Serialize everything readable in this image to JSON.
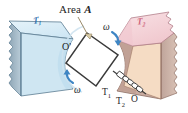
{
  "figure": {
    "caption_labels": {
      "area_label_prefix": "Area ",
      "area_label_symbol": "A",
      "origin_prime": "O'",
      "origin": "O",
      "omega_top": "ω",
      "omega_bottom": "ω",
      "reservoir_hot_label": "T",
      "reservoir_hot_sub": "1",
      "reservoir_cold_label": "T",
      "reservoir_cold_sub": "2",
      "block_left_label": "T",
      "block_left_sub": "1",
      "block_right_label": "T",
      "block_right_sub": "2"
    },
    "colors": {
      "block_left_top": "#d8ecf5",
      "block_left_front": "#cfe6f2",
      "block_left_side": "#9fb4c4",
      "block_left_edge": "#6a8ba3",
      "block_left_text": "#2f6fae",
      "block_right_top": "#f5d3d8",
      "block_right_front": "#f5dcc4",
      "block_right_side": "#c3a89e",
      "block_right_edge": "#a07c72",
      "block_right_text": "#cc5f79",
      "arrow_blue": "#3f86c4",
      "outline": "#3a3a3a",
      "plate_fill": "#ffffff",
      "background": "#ffffff"
    },
    "elements": {
      "rotating_plate_name": "rotating-square-plate",
      "left_reservoir_name": "left-thermal-reservoir-block",
      "right_reservoir_name": "right-thermal-reservoir-block",
      "coil_link_name": "coil-spring-linkage"
    }
  }
}
